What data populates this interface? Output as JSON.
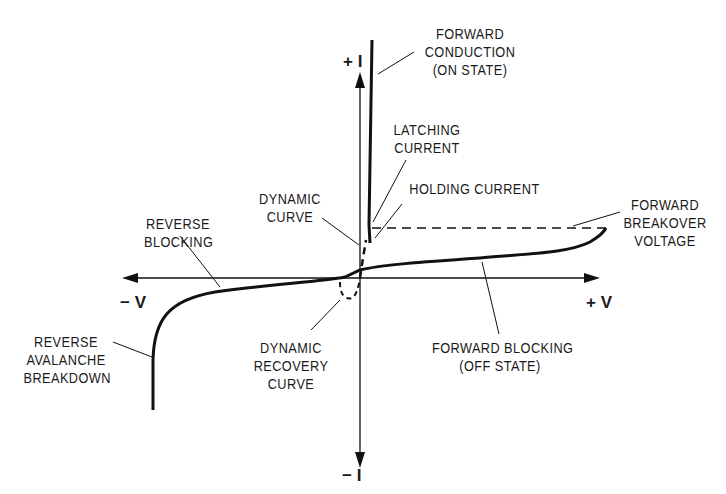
{
  "diagram": {
    "axes": {
      "plus_i": "+ I",
      "minus_i": "− I",
      "plus_v": "+ V",
      "minus_v": "− V"
    },
    "labels": {
      "forward_conduction": "FORWARD\nCONDUCTION\n(ON STATE)",
      "latching_current": "LATCHING\nCURRENT",
      "holding_current": "HOLDING CURRENT",
      "dynamic_curve": "DYNAMIC\nCURVE",
      "reverse_blocking": "REVERSE\nBLOCKING",
      "forward_breakover": "FORWARD\nBREAKOVER\nVOLTAGE",
      "reverse_avalanche": "REVERSE\nAVALANCHE\nBREAKDOWN",
      "dynamic_recovery": "DYNAMIC\nRECOVERY\nCURVE",
      "forward_blocking": "FORWARD BLOCKING\n(OFF STATE)"
    },
    "colors": {
      "line": "#111111",
      "background": "#ffffff"
    }
  }
}
